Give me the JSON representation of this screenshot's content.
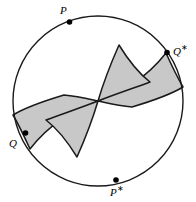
{
  "figure": {
    "type": "geometric-diagram",
    "width": 196,
    "height": 202,
    "background_color": "#ffffff"
  },
  "colors": {
    "stroke": "#1a1a1a",
    "shaded_fill": "#c8c8c8",
    "marker": "#000000",
    "background": "#ffffff"
  },
  "circle": {
    "center_x": 98,
    "center_y": 101,
    "radius": 85,
    "stroke_width": 1.4
  },
  "labels": {
    "p": {
      "text": "P",
      "star": "",
      "x": 60,
      "y": 4
    },
    "q_star": {
      "text": "Q",
      "star": "∗",
      "x": 173,
      "y": 42
    },
    "q": {
      "text": "Q",
      "star": "",
      "x": 10,
      "y": 136
    },
    "p_star": {
      "text": "P",
      "star": "∗",
      "x": 110,
      "y": 184
    }
  },
  "markers": [
    {
      "name": "marker-p",
      "x": 69.5,
      "y": 22.0,
      "r": 2.8
    },
    {
      "name": "marker-q-star",
      "x": 167.0,
      "y": 52.5,
      "r": 2.8
    },
    {
      "name": "marker-q",
      "x": 25.5,
      "y": 133.0,
      "r": 2.8
    },
    {
      "name": "marker-p-star",
      "x": 116.0,
      "y": 180.0,
      "r": 2.8
    }
  ],
  "shapes": {
    "upper_right_lobe": "M 98 101 C 104 86 112 66 119 46 C 126 57 135 70 147 80 C 132 86 115 93 98 101 Z",
    "right_wing": "M 98 101 C 118 92 142 83 167 52.5 C 172 66 177 78 182 88 C 168 95 150 101 130 106 C 118 105 107 103 98 101 Z",
    "lower_left_lobe": "M 98 101 C 92 116 84 136 77 156 C 70 145 61 132 49 122 C 64 116 81 109 98 101 Z",
    "left_wing": "M 98 101 C 78 110 54 119 29 149.5 C 24 136 19 124 14 114 C 28 107 46 101 66 96 C 78 97 89 99 98 101 Z"
  },
  "paths": {
    "upper_cusp": "M 98 101 C 104 86 112 66 119 46",
    "lower_cusp": "M 98 101 C 92 116 84 136 77 156"
  }
}
